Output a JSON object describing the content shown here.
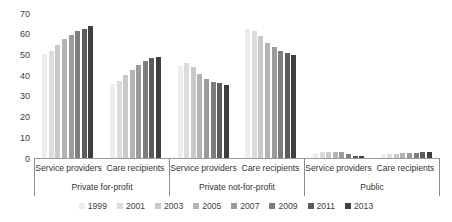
{
  "chart_data": {
    "type": "bar",
    "title": "",
    "subtitle": "",
    "xlabel": "",
    "ylabel": "",
    "ylim": [
      0,
      70
    ],
    "y_ticks": [
      0,
      10,
      20,
      30,
      40,
      50,
      60,
      70
    ],
    "grid": false,
    "legend_position": "bottom",
    "series_names": [
      "1999",
      "2001",
      "2003",
      "2005",
      "2007",
      "2009",
      "2011",
      "2013"
    ],
    "series_colors": [
      "#ededed",
      "#dcdcdc",
      "#c9c9c9",
      "#b4b4b4",
      "#9b9b9b",
      "#7d7d7d",
      "#5c5c5c",
      "#3f3f3f"
    ],
    "group_labels": [
      "Private for-profit",
      "Private not-for-profit",
      "Public"
    ],
    "categories": [
      "Service providers",
      "Care recipients"
    ],
    "groups": [
      {
        "name": "Private for-profit",
        "categories": [
          {
            "name": "Service providers",
            "values": [
              50.8,
              52.0,
              55.0,
              57.8,
              60.0,
              61.8,
              63.0,
              64.0
            ]
          },
          {
            "name": "Care recipients",
            "values": [
              36.2,
              37.8,
              40.8,
              42.8,
              45.2,
              47.2,
              49.0,
              49.2
            ]
          }
        ]
      },
      {
        "name": "Private not-for-profit",
        "categories": [
          {
            "name": "Service providers",
            "values": [
              45.0,
              46.2,
              44.2,
              41.0,
              38.5,
              37.2,
              36.8,
              35.8
            ]
          },
          {
            "name": "Care recipients",
            "values": [
              63.0,
              61.8,
              59.2,
              55.8,
              54.0,
              52.2,
              51.2,
              50.2
            ]
          }
        ]
      },
      {
        "name": "Public",
        "categories": [
          {
            "name": "Service providers",
            "values": [
              3.0,
              3.2,
              3.2,
              3.4,
              3.4,
              2.2,
              1.4,
              1.6
            ]
          },
          {
            "name": "Care recipients",
            "values": [
              2.6,
              2.6,
              2.6,
              2.8,
              2.8,
              3.0,
              3.4,
              3.4
            ]
          }
        ]
      }
    ]
  },
  "axis": {
    "y_ticks": [
      "70",
      "60",
      "50",
      "40",
      "30",
      "20",
      "10",
      "0"
    ]
  },
  "legend": {
    "items": [
      {
        "label": "1999",
        "color": "#ededed"
      },
      {
        "label": "2001",
        "color": "#dcdcdc"
      },
      {
        "label": "2003",
        "color": "#c9c9c9"
      },
      {
        "label": "2005",
        "color": "#b4b4b4"
      },
      {
        "label": "2007",
        "color": "#9b9b9b"
      },
      {
        "label": "2009",
        "color": "#7d7d7d"
      },
      {
        "label": "2011",
        "color": "#5c5c5c"
      },
      {
        "label": "2013",
        "color": "#3f3f3f"
      }
    ]
  }
}
